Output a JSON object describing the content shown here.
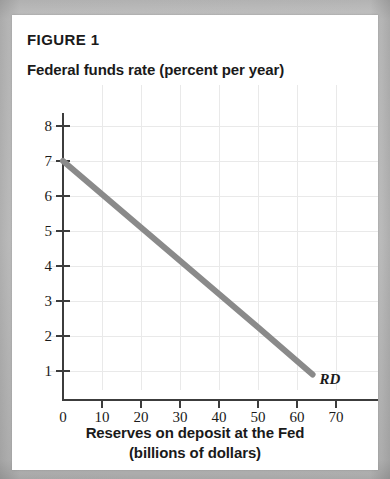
{
  "figure": {
    "title": "FIGURE 1",
    "rd_label": "RD"
  },
  "chart_data": {
    "type": "line",
    "title": "FIGURE 1",
    "ylabel": "Federal funds rate (percent per year)",
    "xlabel_line1": "Reserves on deposit at the Fed",
    "xlabel_line2": "(billions of dollars)",
    "xlim": [
      0,
      75
    ],
    "ylim": [
      0,
      8.2
    ],
    "grid": true,
    "legend": "none",
    "x_ticks": [
      0,
      10,
      20,
      30,
      40,
      50,
      60,
      70
    ],
    "x_tick_labels": [
      "0",
      "10",
      "20",
      "30",
      "40",
      "50",
      "60",
      "70"
    ],
    "y_ticks": [
      1,
      2,
      3,
      4,
      5,
      6,
      7,
      8
    ],
    "y_tick_labels": [
      "1",
      "2",
      "3",
      "4",
      "5",
      "6",
      "7",
      "8"
    ],
    "series": [
      {
        "name": "RD",
        "label": "RD",
        "annotation": "RD",
        "color": "#8a8a8a",
        "linewidth": 6,
        "x": [
          0,
          10,
          20,
          30,
          40,
          50,
          64
        ],
        "y": [
          7.0,
          6.05,
          5.1,
          4.15,
          3.2,
          2.25,
          0.9
        ]
      }
    ]
  }
}
